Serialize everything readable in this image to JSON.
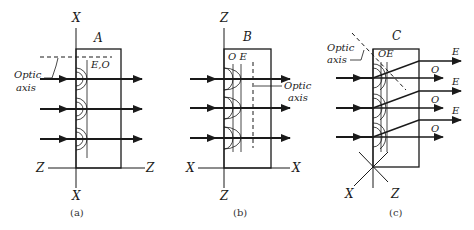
{
  "figure": {
    "panels": [
      {
        "id": "a",
        "caption": "(a)",
        "crystal_label": "A",
        "vertical_axis_label_top": "X",
        "vertical_axis_label_bottom": "X",
        "horizontal_axis_label_left": "Z",
        "horizontal_axis_label_right": "Z",
        "wavefront_label": "E,O",
        "optic_axis_label_line1": "Optic",
        "optic_axis_label_line2": "axis"
      },
      {
        "id": "b",
        "caption": "(b)",
        "crystal_label": "B",
        "vertical_axis_label_top": "Z",
        "vertical_axis_label_bottom": "Z",
        "horizontal_axis_label_left": "X",
        "horizontal_axis_label_right": "X",
        "wavefront_label": "O E",
        "optic_axis_label_line1": "Optic",
        "optic_axis_label_line2": "axis"
      },
      {
        "id": "c",
        "caption": "(c)",
        "crystal_label": "C",
        "axis_label_left": "X",
        "axis_label_right": "Z",
        "wavefront_label": "OE",
        "optic_axis_label_line1": "Optic",
        "optic_axis_label_line2": "axis",
        "ray_labels": [
          "E",
          "O",
          "E",
          "O",
          "E",
          "O"
        ]
      }
    ]
  }
}
